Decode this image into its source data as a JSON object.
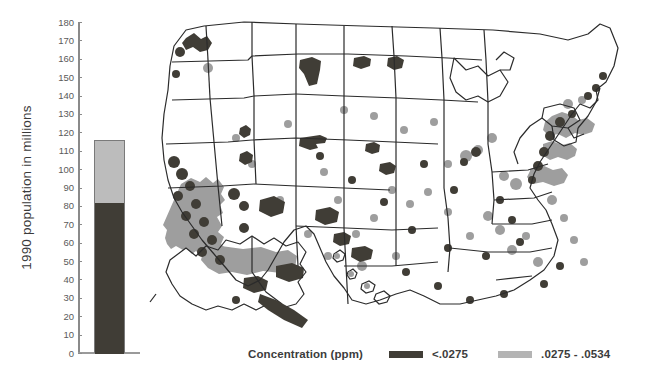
{
  "figure": {
    "background": "#ffffff",
    "width": 655,
    "height": 384
  },
  "chart_data": {
    "type": "bar",
    "title": "",
    "subtitle": "",
    "xlabel": "",
    "ylabel": "1990 population in millions",
    "categories": [
      "U.S. population"
    ],
    "stacked": true,
    "ylim": [
      0,
      180
    ],
    "ytick_step": 10,
    "yticks": [
      0,
      10,
      20,
      30,
      40,
      50,
      60,
      70,
      80,
      90,
      100,
      110,
      120,
      130,
      140,
      150,
      160,
      170,
      180
    ],
    "ytick_labels": [
      "0",
      "10",
      "20",
      "30",
      "40",
      "50",
      "60",
      "70",
      "80",
      "90",
      "100",
      "110",
      "120",
      "130",
      "140",
      "150",
      "160",
      "170",
      "180"
    ],
    "grid": false,
    "legend_position": "bottom",
    "series": [
      {
        "name": "<.0275",
        "color": "#403d36",
        "values": [
          82
        ]
      },
      {
        "name": ".0275 - .0534",
        "color": "#bcbcbc",
        "values": [
          34
        ]
      }
    ],
    "total": 116,
    "annotations": []
  },
  "map": {
    "title": "",
    "type": "choropleth",
    "region": "United States",
    "insets": [
      "Alaska",
      "Hawaii"
    ],
    "border_color": "#2b2b2b",
    "fill_color": "#ffffff",
    "class_colors": {
      "low": "#403d36",
      "mid": "#9e9e9e"
    }
  },
  "legend": {
    "title": "Concentration (ppm)",
    "entries": [
      {
        "label": "<.0275",
        "color": "#403d36"
      },
      {
        "label": ".0275 - .0534",
        "color": "#b4b4b4"
      }
    ]
  }
}
